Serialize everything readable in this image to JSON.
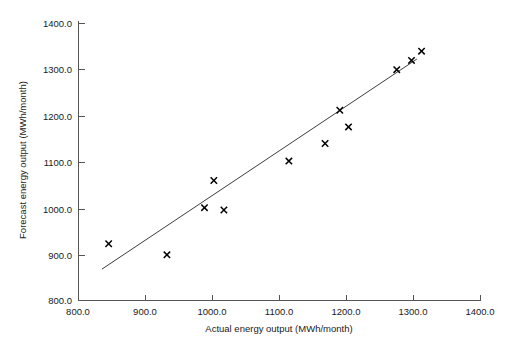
{
  "chart_data": {
    "type": "scatter",
    "title": "",
    "xlabel": "Actual energy output (MWh/month)",
    "ylabel": "Forecast energy output (MWh/month)",
    "xlim": [
      800,
      1400
    ],
    "ylim": [
      800,
      1400
    ],
    "xticks": [
      800,
      900,
      1000,
      1100,
      1200,
      1300,
      1400
    ],
    "yticks": [
      800,
      900,
      1000,
      1100,
      1200,
      1300,
      1400
    ],
    "xtick_labels": [
      "800.0",
      "900.0",
      "1000.0",
      "1100.0",
      "1200.0",
      "1300.0",
      "1400.0"
    ],
    "ytick_labels": [
      "800.0",
      "900.0",
      "1000.0",
      "1100.0",
      "1200.0",
      "1300.0",
      "1400.0"
    ],
    "grid": false,
    "legend": "none",
    "marker": "x",
    "marker_color": "#000000",
    "line_color": "#3d3d3d",
    "x": [
      845,
      932,
      988,
      1002,
      1017,
      1114,
      1168,
      1190,
      1203,
      1275,
      1297,
      1312
    ],
    "y": [
      923,
      899,
      1001,
      1060,
      996,
      1102,
      1140,
      1212,
      1176,
      1300,
      1320,
      1340
    ],
    "series": [
      {
        "name": "Forecast vs actual",
        "type": "scatter",
        "points": [
          {
            "x": 845,
            "y": 923
          },
          {
            "x": 932,
            "y": 899
          },
          {
            "x": 988,
            "y": 1001
          },
          {
            "x": 1002,
            "y": 1060
          },
          {
            "x": 1017,
            "y": 996
          },
          {
            "x": 1114,
            "y": 1102
          },
          {
            "x": 1168,
            "y": 1140
          },
          {
            "x": 1190,
            "y": 1212
          },
          {
            "x": 1203,
            "y": 1176
          },
          {
            "x": 1275,
            "y": 1300
          },
          {
            "x": 1297,
            "y": 1320
          },
          {
            "x": 1312,
            "y": 1340
          }
        ]
      },
      {
        "name": "Trend line",
        "type": "line",
        "points": [
          {
            "x": 835,
            "y": 868
          },
          {
            "x": 1305,
            "y": 1323
          }
        ]
      }
    ]
  },
  "caption": {
    "text": "",
    "visible": false
  }
}
